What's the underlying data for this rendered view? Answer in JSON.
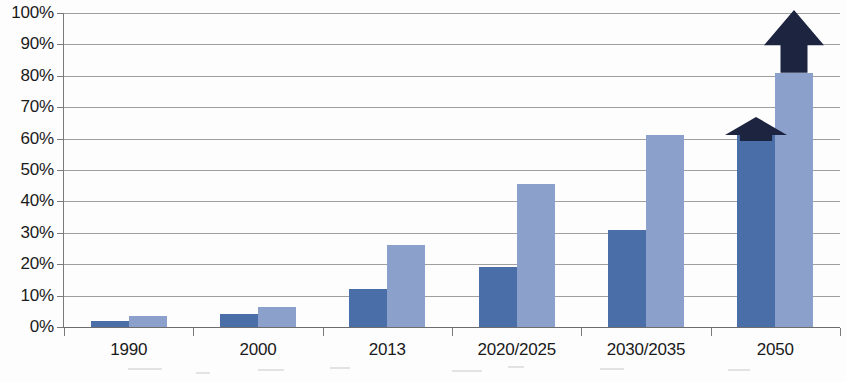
{
  "chart_data": {
    "type": "bar",
    "title": "",
    "subtitle": "",
    "xlabel": "",
    "ylabel": "",
    "categories": [
      "1990",
      "2000",
      "2013",
      "2020/2025",
      "2030/2035",
      "2050"
    ],
    "series": [
      {
        "name": "series-1-dark",
        "color": "#4a6fa8",
        "values": [
          2,
          4,
          12,
          19,
          31,
          61
        ]
      },
      {
        "name": "series-2-light",
        "color": "#8ca0cc",
        "values": [
          3.5,
          6.5,
          26,
          45.5,
          61,
          81
        ]
      }
    ],
    "ylim": [
      0,
      100
    ],
    "y_ticks": [
      "0%",
      "10%",
      "20%",
      "30%",
      "40%",
      "50%",
      "60%",
      "70%",
      "80%",
      "90%",
      "100%"
    ],
    "y_tick_values": [
      0,
      10,
      20,
      30,
      40,
      50,
      60,
      70,
      80,
      90,
      100
    ],
    "y_unit": "%",
    "grid": true,
    "legend": false,
    "legend_position": "none",
    "annotations": [
      {
        "name": "growth-arrow-small",
        "shape": "up-arrow",
        "color": "#1c2440",
        "over_category": "2050",
        "over_series": "series-1-dark",
        "from_value": 61,
        "to_value": 67
      },
      {
        "name": "growth-arrow-large",
        "shape": "up-arrow",
        "color": "#1c2440",
        "over_category": "2050",
        "over_series": "series-2-light",
        "from_value": 81,
        "to_value": 101
      }
    ]
  },
  "colors": {
    "series_dark": "#4a6fa8",
    "series_light": "#8ca0cc",
    "arrow": "#1c2440",
    "gridline": "#8e8e8e",
    "axis": "#7a7a7a",
    "text": "#1a1a1a",
    "background": "#fdfdfd"
  }
}
